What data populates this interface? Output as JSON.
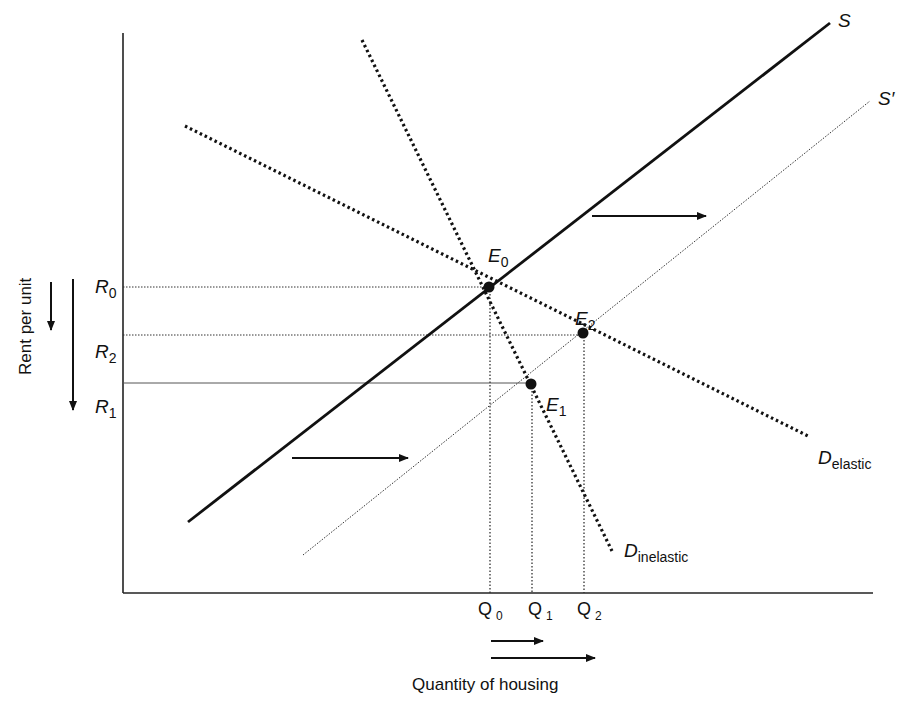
{
  "diagram": {
    "axes": {
      "x_title": "Quantity of housing",
      "y_title": "Rent per unit"
    },
    "curves": {
      "supply": {
        "label": "S",
        "style": "solid-thick"
      },
      "supply_shifted": {
        "label": "S′",
        "style": "dotted-thin"
      },
      "demand_elastic": {
        "label_main": "D",
        "label_sub": "elastic",
        "style": "dotted-thick"
      },
      "demand_inelastic": {
        "label_main": "D",
        "label_sub": "inelastic",
        "style": "dotted-thick"
      }
    },
    "equilibria": [
      {
        "label_main": "E",
        "label_sub": "0",
        "description": "S meets both demands"
      },
      {
        "label_main": "E",
        "label_sub": "1",
        "description": "S′ meets D inelastic"
      },
      {
        "label_main": "E",
        "label_sub": "2",
        "description": "S′ meets D elastic"
      }
    ],
    "rent_levels": [
      {
        "main": "R",
        "sub": "0"
      },
      {
        "main": "R",
        "sub": "2"
      },
      {
        "main": "R",
        "sub": "1"
      }
    ],
    "quantity_levels": [
      {
        "main": "Q",
        "sub": "0"
      },
      {
        "main": "Q",
        "sub": "1"
      },
      {
        "main": "Q",
        "sub": "2"
      }
    ],
    "arrows": {
      "supply_shift": "rightward shift of supply",
      "rent_fall": "rent falls (short: R0→R2, long: R0→R1)",
      "quantity_rise": "quantity rises (short: Q0→Q1, long: Q0→Q2)"
    },
    "colors": {
      "ink": "#111111",
      "background": "#ffffff"
    }
  }
}
